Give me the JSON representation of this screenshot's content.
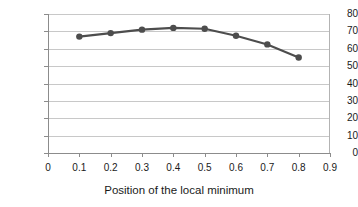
{
  "chart_data": {
    "type": "line",
    "title": "",
    "subtitle": "",
    "xlabel": "Position of the local minimum",
    "ylabel": "Effort",
    "x": [
      0.1,
      0.2,
      0.3,
      0.4,
      0.5,
      0.6,
      0.7,
      0.8
    ],
    "values": [
      67,
      69,
      71,
      72,
      71.5,
      67.5,
      62.5,
      55
    ],
    "series": [
      {
        "name": "Effort",
        "x": [
          0.1,
          0.2,
          0.3,
          0.4,
          0.5,
          0.6,
          0.7,
          0.8
        ],
        "values": [
          67,
          69,
          71,
          72,
          71.5,
          67.5,
          62.5,
          55
        ]
      }
    ],
    "xlim": [
      0,
      0.9
    ],
    "ylim": [
      0,
      80
    ],
    "xticks": [
      "0",
      "0.1",
      "0.2",
      "0.3",
      "0.4",
      "0.5",
      "0.6",
      "0.7",
      "0.8",
      "0.9"
    ],
    "xtick_values": [
      0,
      0.1,
      0.2,
      0.3,
      0.4,
      0.5,
      0.6,
      0.7,
      0.8,
      0.9
    ],
    "yticks": [
      "0",
      "10",
      "20",
      "30",
      "40",
      "50",
      "60",
      "70",
      "80"
    ],
    "ytick_values": [
      0,
      10,
      20,
      30,
      40,
      50,
      60,
      70,
      80
    ],
    "grid": "horizontal",
    "legend": "none",
    "marker": "circle",
    "series_color": "#4d4d4d",
    "grid_color": "#c8c8c8",
    "axis_color": "#8c8c8c",
    "text_color": "#1a1a1a"
  }
}
